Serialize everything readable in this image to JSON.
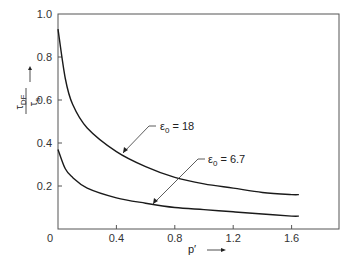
{
  "chart_data": {
    "type": "line",
    "title": "",
    "xlabel": "p′ →",
    "ylabel": "τ_DF / τ_s →",
    "xlim": [
      0,
      1.9
    ],
    "ylim": [
      0,
      1.0
    ],
    "x_ticks": [
      "0",
      "0.4",
      "0.8",
      "1.2",
      "1.6"
    ],
    "y_ticks": [
      "0",
      "0.2",
      "0.4",
      "0.6",
      "0.8",
      "1.0"
    ],
    "grid": false,
    "legend": "inline annotations with leader arrows",
    "series": [
      {
        "name": "ε0 = 18",
        "x": [
          0.0,
          0.05,
          0.1,
          0.2,
          0.4,
          0.6,
          0.8,
          1.0,
          1.2,
          1.4,
          1.6,
          1.65
        ],
        "y": [
          0.93,
          0.7,
          0.58,
          0.47,
          0.36,
          0.29,
          0.24,
          0.21,
          0.19,
          0.17,
          0.16,
          0.16
        ]
      },
      {
        "name": "ε0 = 6.7",
        "x": [
          0.0,
          0.05,
          0.1,
          0.2,
          0.4,
          0.6,
          0.8,
          1.0,
          1.2,
          1.4,
          1.6,
          1.65
        ],
        "y": [
          0.37,
          0.28,
          0.24,
          0.19,
          0.145,
          0.12,
          0.1,
          0.09,
          0.08,
          0.07,
          0.06,
          0.06
        ]
      }
    ]
  },
  "labels": {
    "y_num": "τ",
    "y_num_sub": "DF",
    "y_den": "τ",
    "y_den_sub": "s",
    "x_label": "p′",
    "anno1_main": "ε",
    "anno1_sub": "0",
    "anno1_val": " = 18",
    "anno2_main": "ε",
    "anno2_sub": "0",
    "anno2_val": " = 6.7"
  }
}
